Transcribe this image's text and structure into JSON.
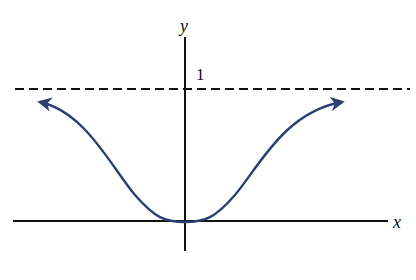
{
  "figure": {
    "type": "function-graph",
    "axes": {
      "x_label": "x",
      "y_label": "y"
    },
    "asymptote": {
      "label": "1",
      "style": "dashed",
      "value": 1
    },
    "curve": {
      "color": "#2b3f73",
      "minimum": [
        0,
        0
      ],
      "ends": "arrows pointing outward toward asymptote"
    },
    "colors": {
      "axes": "#111111",
      "asymptote": "#111111",
      "curve": "#2b3f73"
    }
  }
}
